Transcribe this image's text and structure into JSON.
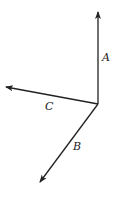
{
  "diagram": {
    "origin": [
      98,
      104
    ],
    "vectors": [
      {
        "name": "A",
        "tip": [
          98,
          12
        ],
        "label": "A",
        "label_pos": [
          102,
          52
        ]
      },
      {
        "name": "C",
        "tip": [
          6,
          87
        ],
        "label": "C",
        "label_pos": [
          45,
          101
        ]
      },
      {
        "name": "B",
        "tip": [
          40,
          182
        ],
        "label": "B",
        "label_pos": [
          73,
          141
        ]
      }
    ],
    "stroke": "#222222"
  }
}
